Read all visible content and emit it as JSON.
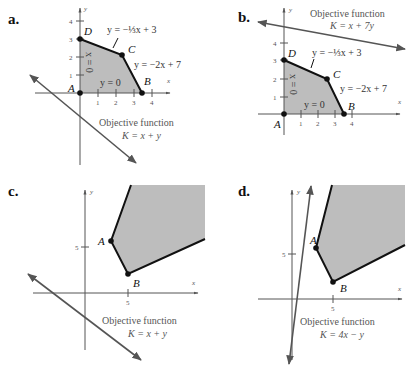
{
  "panels": {
    "a": {
      "label": "a.",
      "axis_x": "x",
      "axis_y": "y",
      "x_ticks": [
        "1",
        "2",
        "3",
        "4"
      ],
      "y_ticks": [
        "1",
        "2",
        "3",
        "4"
      ],
      "vertices": {
        "A": "A",
        "B": "B",
        "C": "C",
        "D": "D"
      },
      "eq_top": "y = −⅓x + 3",
      "eq_right": "y = −2x + 7",
      "eq_bottom": "y = 0",
      "eq_left": "x = 0",
      "objective_title": "Objective function",
      "objective_eq": "K = x + y"
    },
    "b": {
      "label": "b.",
      "axis_x": "x",
      "axis_y": "y",
      "x_ticks": [
        "1",
        "2",
        "3",
        "4"
      ],
      "y_ticks": [
        "1",
        "2",
        "3",
        "4"
      ],
      "vertices": {
        "A": "A",
        "B": "B",
        "C": "C",
        "D": "D"
      },
      "eq_top": "y = −⅓x + 3",
      "eq_right": "y = −2x + 7",
      "eq_bottom": "y = 0",
      "eq_left": "x = 0",
      "objective_title": "Objective function",
      "objective_eq": "K = x + 7y"
    },
    "c": {
      "label": "c.",
      "axis_x": "x",
      "axis_y": "y",
      "x_ticks": [
        "5"
      ],
      "y_ticks": [
        "5"
      ],
      "vertices": {
        "A": "A",
        "B": "B"
      },
      "objective_title": "Objective function",
      "objective_eq": "K = x + y"
    },
    "d": {
      "label": "d.",
      "axis_x": "x",
      "axis_y": "y",
      "x_ticks": [
        "5"
      ],
      "y_ticks": [
        "5"
      ],
      "vertices": {
        "A": "A",
        "B": "B"
      },
      "objective_title": "Objective function",
      "objective_eq": "K = 4x − y"
    }
  },
  "colors": {
    "region_fill": "#bdbdbd",
    "boundary": "#111111",
    "axis": "#555555"
  }
}
